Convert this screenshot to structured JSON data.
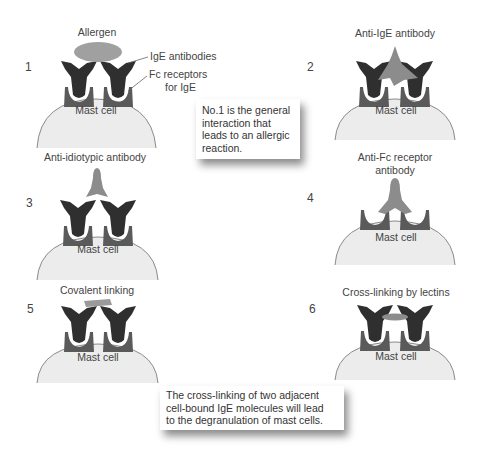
{
  "colors": {
    "ige": "#2f2f2f",
    "receptor": "#5a5a5a",
    "cell_fill": "#ececec",
    "cell_stroke": "#8a8a8a",
    "allergen": "#9a9a9a",
    "reagent": "#8c8c8c"
  },
  "panels": [
    {
      "number": "1",
      "title": "Allergen",
      "cell_label": "Mast cell",
      "callouts": [
        "IgE antibodies",
        "Fc receptors",
        "for IgE"
      ]
    },
    {
      "number": "2",
      "title": "Anti-IgE antibody",
      "cell_label": "Mast cell"
    },
    {
      "number": "3",
      "title": "Anti-idiotypic antibody",
      "cell_label": "Mast cell"
    },
    {
      "number": "4",
      "title": "Anti-Fc receptor",
      "title_line2": "antibody",
      "cell_label": "Mast cell"
    },
    {
      "number": "5",
      "title": "Covalent linking",
      "cell_label": "Mast cell"
    },
    {
      "number": "6",
      "title": "Cross-linking by lectins",
      "cell_label": "Mast cell"
    }
  ],
  "notes": [
    {
      "lines": [
        "No.1 is the general",
        "interaction that",
        "leads to an allergic",
        "reaction."
      ]
    },
    {
      "lines": [
        "The cross-linking of two adjacent",
        "cell-bound IgE molecules will lead",
        "to the degranulation of mast cells."
      ]
    }
  ]
}
